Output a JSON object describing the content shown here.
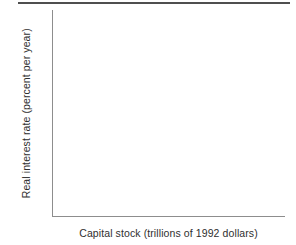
{
  "figure": {
    "background_color": "#ffffff",
    "rule_color": "#4f4f4f",
    "axis_color": "#8d8d8d",
    "text_color": "#2f2f2f"
  },
  "chart_data": {
    "type": "line",
    "title": "",
    "subtitle": "",
    "xlabel": "Capital stock (trillions of 1992 dollars)",
    "ylabel": "Real interest rate (percent per year)",
    "categories": [],
    "series": [],
    "x": [],
    "values": [],
    "xticklabels": [],
    "yticklabels": [],
    "xlim": [],
    "ylim": [],
    "grid": false,
    "legend": false,
    "legend_position": "none",
    "annotations": [],
    "note": "Blank axes template: plot area is empty with no plotted data, tick marks, tick labels, gridlines, or legend."
  }
}
